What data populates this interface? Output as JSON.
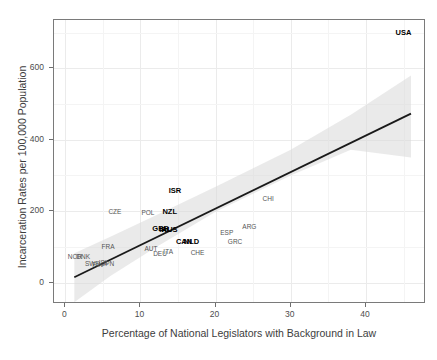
{
  "chart_data": {
    "type": "scatter",
    "title": "",
    "xlabel": "Percentage of National Legislators with Background in Law",
    "ylabel": "Incarceration Rates per 100,000 Population",
    "xlim": [
      -1.5,
      48
    ],
    "ylim": [
      -60,
      735
    ],
    "xticks": [
      0,
      10,
      20,
      30,
      40
    ],
    "xticklabels": [
      "0",
      "10",
      "20",
      "30",
      "40"
    ],
    "yticks": [
      0,
      200,
      400,
      600
    ],
    "yticklabels": [
      "0",
      "200",
      "400",
      "600"
    ],
    "grid": true,
    "grid_color": "#ebebeb",
    "legend": "none",
    "point_render": "text-labels",
    "annotations": [
      {
        "label": "USA",
        "x": 45.0,
        "y": 698,
        "style": "bold"
      },
      {
        "label": "CHI",
        "x": 27.0,
        "y": 233,
        "style": "plain"
      },
      {
        "label": "ISR",
        "x": 14.6,
        "y": 256,
        "style": "bold"
      },
      {
        "label": "NZL",
        "x": 13.9,
        "y": 199,
        "style": "bold"
      },
      {
        "label": "POL",
        "x": 11.0,
        "y": 196,
        "style": "plain"
      },
      {
        "label": "CZE",
        "x": 6.6,
        "y": 197,
        "style": "plain"
      },
      {
        "label": "ARG",
        "x": 24.5,
        "y": 155,
        "style": "plain"
      },
      {
        "label": "ESP",
        "x": 21.5,
        "y": 138,
        "style": "plain"
      },
      {
        "label": "GRC",
        "x": 22.6,
        "y": 113,
        "style": "plain"
      },
      {
        "label": "GBR",
        "x": 12.7,
        "y": 149,
        "style": "bold"
      },
      {
        "label": "IRL",
        "x": 13.3,
        "y": 148,
        "style": "bold"
      },
      {
        "label": "AUS",
        "x": 13.9,
        "y": 147,
        "style": "bold"
      },
      {
        "label": "CAN",
        "x": 15.8,
        "y": 114,
        "style": "bold"
      },
      {
        "label": "NLD",
        "x": 16.8,
        "y": 113,
        "style": "bold"
      },
      {
        "label": "CHE",
        "x": 17.6,
        "y": 84,
        "style": "plain"
      },
      {
        "label": "FRA",
        "x": 5.7,
        "y": 100,
        "style": "plain"
      },
      {
        "label": "AUT",
        "x": 11.4,
        "y": 94,
        "style": "plain"
      },
      {
        "label": "DEU",
        "x": 12.6,
        "y": 80,
        "style": "plain"
      },
      {
        "label": "ITA",
        "x": 13.7,
        "y": 86,
        "style": "plain"
      },
      {
        "label": "NOR",
        "x": 1.3,
        "y": 73,
        "style": "plain"
      },
      {
        "label": "DNK",
        "x": 2.4,
        "y": 72,
        "style": "plain"
      },
      {
        "label": "SWE",
        "x": 3.6,
        "y": 53,
        "style": "plain"
      },
      {
        "label": "FIN",
        "x": 4.3,
        "y": 50,
        "style": "plain"
      },
      {
        "label": "ISL",
        "x": 5.1,
        "y": 55,
        "style": "plain"
      },
      {
        "label": "JPN",
        "x": 5.7,
        "y": 52,
        "style": "plain"
      }
    ],
    "fit_line": {
      "type": "linear-regression",
      "color": "#1a1a1a",
      "x_start": 1.2,
      "y_start": 15,
      "x_end": 46.0,
      "y_end": 473
    },
    "confidence_band": {
      "color": "#d9d9d9",
      "opacity": 0.55,
      "upper": [
        {
          "x": 1.2,
          "y": 82
        },
        {
          "x": 6.0,
          "y": 128
        },
        {
          "x": 12.0,
          "y": 188
        },
        {
          "x": 20.0,
          "y": 268
        },
        {
          "x": 30.0,
          "y": 372
        },
        {
          "x": 38.0,
          "y": 470
        },
        {
          "x": 46.0,
          "y": 580
        }
      ],
      "lower": [
        {
          "x": 1.2,
          "y": -55
        },
        {
          "x": 6.0,
          "y": 18
        },
        {
          "x": 12.0,
          "y": 98
        },
        {
          "x": 20.0,
          "y": 198
        },
        {
          "x": 30.0,
          "y": 300
        },
        {
          "x": 38.0,
          "y": 372
        },
        {
          "x": 46.0,
          "y": 350
        }
      ]
    }
  }
}
